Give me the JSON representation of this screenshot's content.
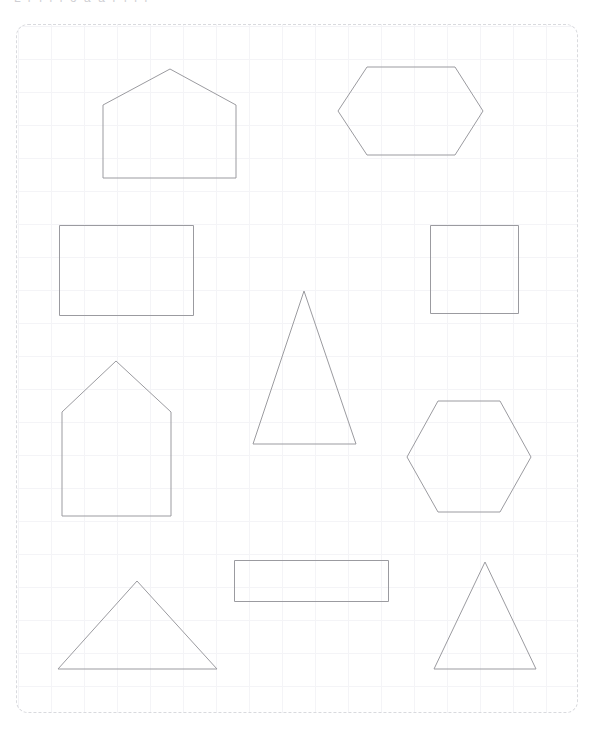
{
  "page": {
    "width": 594,
    "height": 731,
    "background_color": "#ffffff",
    "top_strip_ghost_text": "L   r      l   l   l  o a      a  r           l   l  r"
  },
  "canvas": {
    "name": "shape-canvas",
    "x": 16,
    "y": 24,
    "width": 562,
    "height": 689,
    "border_style": "dashed",
    "border_color": "#d9dade",
    "border_radius": 12,
    "grid": {
      "visible": true,
      "spacing": 33,
      "color": "#f4f4f7"
    }
  },
  "style": {
    "shape_stroke_color": "#9b9ba0",
    "shape_stroke_width": 1,
    "shape_fill": "none"
  },
  "shapes": [
    {
      "id": "shape-1",
      "name": "pentagon-house-top-left",
      "kind": "pentagon",
      "label": "Pentagon",
      "points": "103,105 170,69 236,105 236,178 103,178",
      "bbox": {
        "x": 103,
        "y": 69,
        "width": 133,
        "height": 109
      }
    },
    {
      "id": "shape-2",
      "name": "hexagon-wide-top-right",
      "kind": "hexagon",
      "label": "Hexagon",
      "points": "338,111 367,67 455,67 483,111 455,155 367,155",
      "bbox": {
        "x": 338,
        "y": 67,
        "width": 145,
        "height": 88
      }
    },
    {
      "id": "shape-3",
      "name": "rectangle-left-middle",
      "kind": "rectangle",
      "label": "Rectangle",
      "bbox": {
        "x": 59,
        "y": 225,
        "width": 134,
        "height": 90
      }
    },
    {
      "id": "shape-4",
      "name": "square-right-middle",
      "kind": "square",
      "label": "Square",
      "bbox": {
        "x": 430,
        "y": 225,
        "width": 88,
        "height": 88
      }
    },
    {
      "id": "shape-5",
      "name": "triangle-tall-center",
      "kind": "triangle",
      "label": "Triangle",
      "points": "304,291 356,444 253,444",
      "bbox": {
        "x": 253,
        "y": 291,
        "width": 103,
        "height": 153
      }
    },
    {
      "id": "shape-6",
      "name": "pentagon-house-left-lower",
      "kind": "pentagon",
      "label": "Pentagon",
      "points": "62,412 116,361 171,412 171,516 62,516",
      "bbox": {
        "x": 62,
        "y": 361,
        "width": 109,
        "height": 155
      }
    },
    {
      "id": "shape-7",
      "name": "hexagon-regular-right-lower",
      "kind": "hexagon",
      "label": "Hexagon",
      "points": "407,457 438,401 500,401 531,457 500,512 438,512",
      "bbox": {
        "x": 407,
        "y": 401,
        "width": 124,
        "height": 111
      }
    },
    {
      "id": "shape-8",
      "name": "rectangle-wide-bottom-center",
      "kind": "rectangle",
      "label": "Rectangle",
      "bbox": {
        "x": 234,
        "y": 560,
        "width": 154,
        "height": 41
      }
    },
    {
      "id": "shape-9",
      "name": "triangle-wide-bottom-left",
      "kind": "triangle",
      "label": "Triangle",
      "points": "137,581 217,669 58,669",
      "bbox": {
        "x": 58,
        "y": 581,
        "width": 159,
        "height": 88
      }
    },
    {
      "id": "shape-10",
      "name": "triangle-bottom-right",
      "kind": "triangle",
      "label": "Triangle",
      "points": "485,562 536,669 434,669",
      "bbox": {
        "x": 434,
        "y": 562,
        "width": 102,
        "height": 107
      }
    }
  ]
}
